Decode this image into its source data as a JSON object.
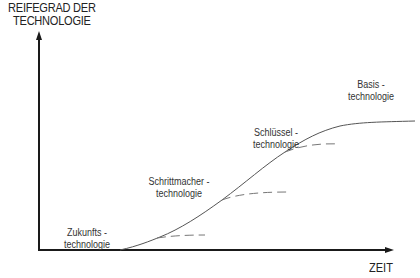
{
  "diagram": {
    "y_axis_label_line1": "REIFEGRAD DER",
    "y_axis_label_line2": "TECHNOLOGIE",
    "x_axis_label": "ZEIT",
    "stages": [
      {
        "line1": "Zukunfts -",
        "line2": "technologie"
      },
      {
        "line1": "Schrittmacher -",
        "line2": "technologie"
      },
      {
        "line1": "Schlüssel -",
        "line2": "technologie"
      },
      {
        "line1": "Basis -",
        "line2": "technologie"
      }
    ],
    "colors": {
      "axis": "#1a1a1a",
      "curve": "#555555",
      "dashed": "#777777",
      "text": "#222222"
    }
  }
}
